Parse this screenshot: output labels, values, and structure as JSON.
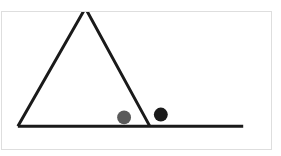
{
  "canvas": {
    "width": 281,
    "height": 156,
    "background": "#ffffff"
  },
  "faint_header": {
    "text": "",
    "color": "#e9e9e9"
  },
  "panel": {
    "border_color": "#dedede",
    "background": "#ffffff",
    "x": 1,
    "y": 11,
    "width": 271,
    "height": 139
  },
  "figure": {
    "stroke_color": "#1a1a1a",
    "stroke_width": 3,
    "ground": {
      "label": "ground-line",
      "x1": 17,
      "y1": 127,
      "x2": 244,
      "y2": 127
    },
    "triangle": {
      "label": "ramp-triangle",
      "apex_x": 85,
      "apex_y": 7,
      "left_x": 17,
      "left_y": 127,
      "right_x": 150,
      "right_y": 127
    },
    "balls": [
      {
        "label": "gray-ball",
        "cx": 124,
        "cy": 118,
        "r": 7,
        "color": "#5a5a5a"
      },
      {
        "label": "black-ball",
        "cx": 161,
        "cy": 115,
        "r": 7,
        "color": "#1a1a1a"
      }
    ]
  }
}
